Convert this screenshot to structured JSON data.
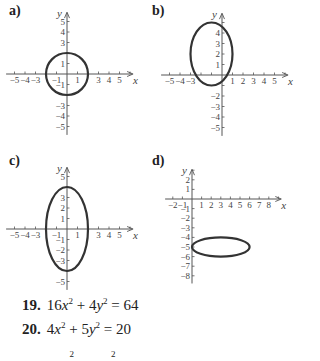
{
  "panels": [
    {
      "label": "a)",
      "origin_px": [
        67,
        74
      ],
      "unit_px": 10.5,
      "x_ticks": [
        -5,
        -4,
        -3,
        -1,
        1,
        3,
        4,
        5
      ],
      "y_ticks": [
        5,
        4,
        3,
        1,
        -1,
        -3,
        -4,
        -5
      ],
      "x_range": [
        -5.8,
        6.2
      ],
      "y_range": [
        -5.8,
        5.8
      ],
      "ellipse": {
        "cx": 0,
        "cy": 0,
        "rx": 2,
        "ry": 2
      }
    },
    {
      "label": "b)",
      "origin_px": [
        222,
        75
      ],
      "unit_px": 10.5,
      "x_ticks": [
        -5,
        -4,
        -3,
        1,
        2,
        3,
        4,
        5
      ],
      "y_ticks": [
        4,
        3,
        2,
        1,
        -2,
        -3,
        -4,
        -5
      ],
      "x_range": [
        -5.8,
        6.2
      ],
      "y_range": [
        -5.8,
        5.8
      ],
      "ellipse": {
        "cx": -1,
        "cy": 2,
        "rx": 2,
        "ry": 3
      }
    },
    {
      "label": "c)",
      "origin_px": [
        67,
        229
      ],
      "unit_px": 10.5,
      "x_ticks": [
        -5,
        -4,
        -3,
        -1,
        1,
        3,
        4,
        5
      ],
      "y_ticks": [
        5,
        3,
        2,
        1,
        -1,
        -2,
        -3,
        -5
      ],
      "x_range": [
        -5.8,
        6.2
      ],
      "y_range": [
        -5.8,
        5.8
      ],
      "ellipse": {
        "cx": 0,
        "cy": 0,
        "rx": 2,
        "ry": 4
      }
    },
    {
      "label": "d)",
      "origin_px": [
        192,
        199
      ],
      "unit_px": 9.6,
      "x_ticks": [
        -2,
        -1,
        1,
        2,
        3,
        4,
        5,
        6,
        7,
        8
      ],
      "y_ticks": [
        2,
        1,
        -1,
        -2,
        -3,
        -4,
        -5,
        -6,
        -7,
        -8
      ],
      "x_range": [
        -2.8,
        9.2
      ],
      "y_range": [
        -8.8,
        3.0
      ],
      "ellipse": {
        "cx": 3,
        "cy": -5,
        "rx": 3,
        "ry": 1
      }
    }
  ],
  "axis_labels": {
    "x": "x",
    "y": "y"
  },
  "exercises": [
    {
      "number": "19.",
      "a": "16",
      "b": "4",
      "rhs": "64"
    },
    {
      "number": "20.",
      "a": "4",
      "b": "5",
      "rhs": "20"
    }
  ],
  "colors": {
    "axis": "#555555",
    "curve": "#333333",
    "text": "#222222"
  }
}
